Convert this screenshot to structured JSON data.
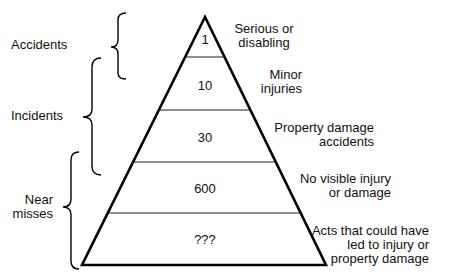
{
  "diagram": {
    "type": "pyramid",
    "levels": [
      {
        "value": "1",
        "description": "Serious or\ndisabling"
      },
      {
        "value": "10",
        "description": "Minor\ninjuries"
      },
      {
        "value": "30",
        "description": "Property damage\naccidents"
      },
      {
        "value": "600",
        "description": "No visible injury\nor damage"
      },
      {
        "value": "???",
        "description": "Acts that could have\nled to injury or\nproperty damage"
      }
    ],
    "groups": [
      {
        "label": "Accidents",
        "spans_levels": [
          1,
          2
        ]
      },
      {
        "label": "Incidents",
        "spans_levels": [
          2,
          3
        ]
      },
      {
        "label": "Near\nmisses",
        "spans_levels": [
          4,
          5
        ]
      }
    ],
    "colors": {
      "stroke": "#000000",
      "background": "#ffffff",
      "text": "#111111"
    }
  }
}
